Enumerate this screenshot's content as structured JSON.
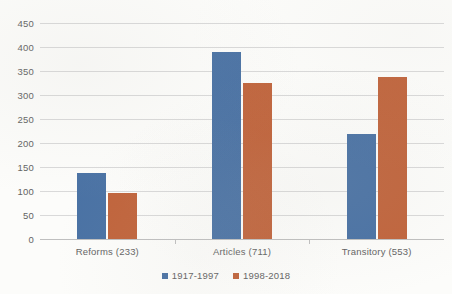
{
  "chart_data": {
    "type": "bar",
    "title": "",
    "subtitle": "",
    "xlabel": "",
    "ylabel": "",
    "categories": [
      "Reforms (233)",
      "Articles (711)",
      "Transitory (553)"
    ],
    "series": [
      {
        "name": "1917-1997",
        "color": "#4A72A4",
        "values": [
          138,
          390,
          218
        ]
      },
      {
        "name": "1998-2018",
        "color": "#C0643C",
        "values": [
          95,
          325,
          337
        ]
      }
    ],
    "ylim": [
      0,
      450
    ],
    "ytick_step": 50,
    "yticks": [
      "450",
      "400",
      "350",
      "300",
      "250",
      "200",
      "150",
      "100",
      "50",
      "0"
    ],
    "grid": true,
    "grid_color": "#D9D9D9",
    "legend_position": "bottom-center",
    "orientation": "vertical",
    "grouping": "clustered"
  }
}
